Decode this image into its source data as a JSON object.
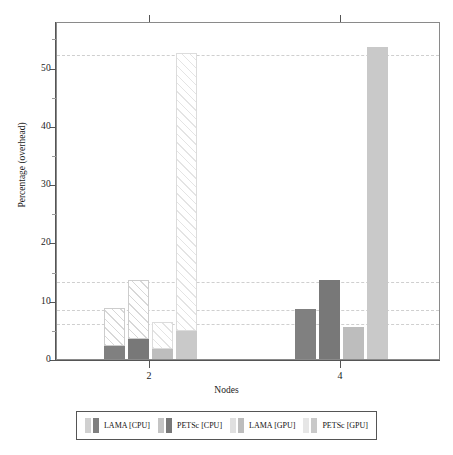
{
  "chart_data": {
    "type": "bar",
    "title": "",
    "xlabel": "Nodes",
    "ylabel": "Percentage (overhead)",
    "categories": [
      "2",
      "4"
    ],
    "ylim": [
      0,
      58
    ],
    "yticks": [
      0,
      10,
      20,
      30,
      40,
      50
    ],
    "ytick_labels": [
      "0",
      "10",
      "20",
      "30",
      "40",
      "50"
    ],
    "grid": "horizontal-dashed-at-bar-tops",
    "legend_position": "below-axes",
    "series": [
      {
        "name": "LAMA [CPU]",
        "color": "#808080",
        "hatch_color": "#d8d8d8",
        "values": [
          8.8,
          8.6
        ],
        "solid_values": [
          2.3,
          8.6
        ]
      },
      {
        "name": "PETSc [CPU]",
        "color": "#787878",
        "hatch_color": "#d8d8d8",
        "values": [
          13.5,
          13.5
        ],
        "solid_values": [
          3.5,
          13.5
        ]
      },
      {
        "name": "LAMA [GPU]",
        "color": "#bdbdbd",
        "hatch_color": "#e4e4e4",
        "values": [
          6.4,
          5.5
        ],
        "solid_values": [
          1.7,
          5.5
        ]
      },
      {
        "name": "PETSc [GPU]",
        "color": "#c9c9c9",
        "hatch_color": "#e8e8e8",
        "values": [
          52.5,
          53.5
        ],
        "solid_values": [
          4.8,
          53.5
        ]
      }
    ],
    "gridline_values": [
      52.5,
      13.5,
      8.7,
      6.4
    ]
  },
  "axes": {
    "y_title": "Percentage (overhead)",
    "x_title": "Nodes",
    "y_ticks": [
      "0",
      "10",
      "20",
      "30",
      "40",
      "50"
    ],
    "x_ticks": [
      "2",
      "4"
    ]
  },
  "legend": {
    "items": [
      {
        "label": "LAMA [CPU]",
        "swatch_hatch": "#d0d0d0",
        "swatch_solid": "#808080"
      },
      {
        "label": "PETSc [CPU]",
        "swatch_hatch": "#c4c4c4",
        "swatch_solid": "#787878"
      },
      {
        "label": "LAMA [GPU]",
        "swatch_hatch": "#e0e0e0",
        "swatch_solid": "#bdbdbd"
      },
      {
        "label": "PETSc [GPU]",
        "swatch_hatch": "#e6e6e6",
        "swatch_solid": "#c9c9c9"
      }
    ]
  }
}
